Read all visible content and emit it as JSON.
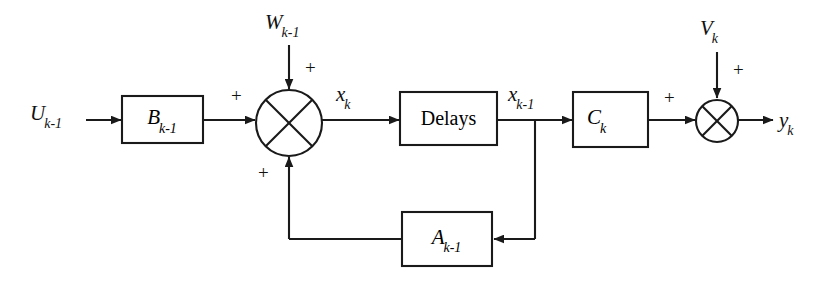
{
  "diagram": {
    "background_color": "#ffffff",
    "line_color": "#1a1a1a",
    "blocks": [
      {
        "id": "b-block",
        "label_main": "B",
        "label_sub": "k-1",
        "x": 122,
        "y": 96,
        "w": 81,
        "h": 47
      },
      {
        "id": "delays-block",
        "label_main": "Delays",
        "label_sub": "",
        "x": 400,
        "y": 92,
        "w": 97,
        "h": 53
      },
      {
        "id": "c-block",
        "label_main": "C",
        "label_sub": "k",
        "x": 573,
        "y": 92,
        "w": 75,
        "h": 55
      },
      {
        "id": "a-block",
        "label_main": "A",
        "label_sub": "k-1",
        "x": 402,
        "y": 212,
        "w": 90,
        "h": 54
      }
    ],
    "summing_junctions": [
      {
        "id": "state-summer",
        "cx": 289,
        "cy": 123,
        "r": 33,
        "style": "cross-in-circle"
      },
      {
        "id": "output-summer",
        "cx": 717,
        "cy": 121,
        "r": 21,
        "style": "cross-in-circle"
      }
    ],
    "signals": [
      {
        "id": "input-u",
        "label_main": "U",
        "label_sub": "k-1",
        "x": 30,
        "y": 103
      },
      {
        "id": "noise-w",
        "label_main": "W",
        "label_sub": "k-1",
        "x": 265,
        "y": 12
      },
      {
        "id": "state-xk",
        "label_main": "x",
        "label_sub": "k",
        "x": 336,
        "y": 84
      },
      {
        "id": "state-xk1",
        "label_main": "x",
        "label_sub": "k-1",
        "x": 508,
        "y": 84
      },
      {
        "id": "noise-v",
        "label_main": "V",
        "label_sub": "k",
        "x": 700,
        "y": 18
      },
      {
        "id": "output-y",
        "label_main": "y",
        "label_sub": "k",
        "x": 779,
        "y": 110
      }
    ],
    "signs": [
      {
        "id": "sign-w-into-state-summer",
        "text": "+",
        "x": 305,
        "y": 58
      },
      {
        "id": "sign-b-into-state-summer",
        "text": "+",
        "x": 231,
        "y": 86
      },
      {
        "id": "sign-a-into-state-summer",
        "text": "+",
        "x": 258,
        "y": 163
      },
      {
        "id": "sign-c-into-output-summer",
        "text": "+",
        "x": 664,
        "y": 88
      },
      {
        "id": "sign-v-into-output-summer",
        "text": "+",
        "x": 733,
        "y": 60
      }
    ],
    "connections": [
      {
        "id": "u-to-b",
        "from": "input-u",
        "to": "b-block"
      },
      {
        "id": "b-to-state-summer",
        "from": "b-block",
        "to": "state-summer"
      },
      {
        "id": "w-to-state-summer",
        "from": "noise-w",
        "to": "state-summer"
      },
      {
        "id": "summer-to-delays",
        "from": "state-summer",
        "to": "delays-block"
      },
      {
        "id": "delays-to-c",
        "from": "delays-block",
        "to": "c-block"
      },
      {
        "id": "delays-to-a",
        "from": "delays-block",
        "to": "a-block"
      },
      {
        "id": "a-to-state-summer",
        "from": "a-block",
        "to": "state-summer"
      },
      {
        "id": "c-to-output-summer",
        "from": "c-block",
        "to": "output-summer"
      },
      {
        "id": "v-to-output-summer",
        "from": "noise-v",
        "to": "output-summer"
      },
      {
        "id": "output-summer-to-y",
        "from": "output-summer",
        "to": "output-y"
      }
    ]
  }
}
